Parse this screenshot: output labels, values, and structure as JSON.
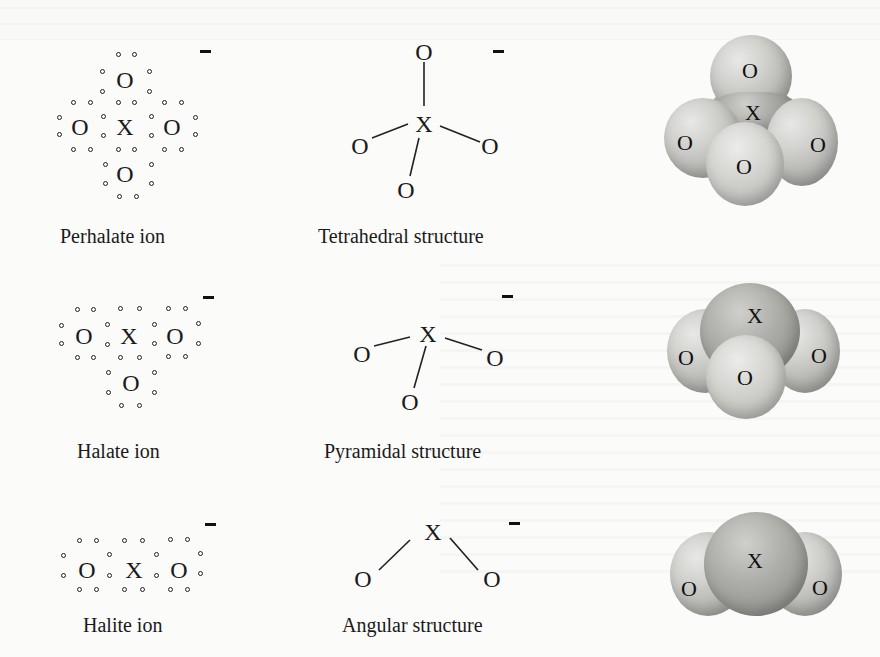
{
  "diagram": {
    "rows": [
      {
        "lewis_caption": "Perhalate ion",
        "structure_caption": "Tetrahedral structure",
        "charge": "−",
        "central_atom": "X",
        "ligand_atom": "O",
        "ligand_count": 4
      },
      {
        "lewis_caption": "Halate ion",
        "structure_caption": "Pyramidal structure",
        "charge": "−",
        "central_atom": "X",
        "ligand_atom": "O",
        "ligand_count": 3
      },
      {
        "lewis_caption": "Halite ion",
        "structure_caption": "Angular structure",
        "charge": "−",
        "central_atom": "X",
        "ligand_atom": "O",
        "ligand_count": 2
      }
    ],
    "atoms": {
      "X": "X",
      "O": "O"
    }
  }
}
